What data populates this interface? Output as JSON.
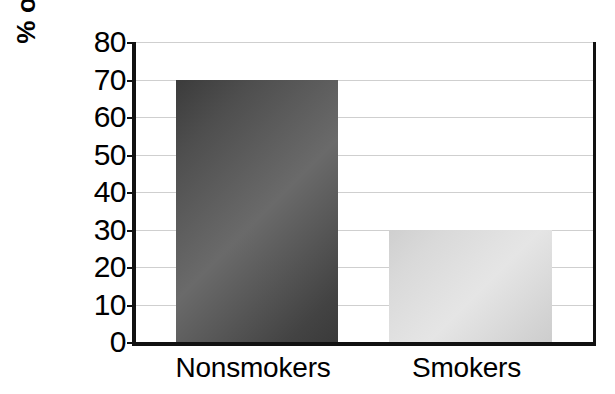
{
  "chart_data": {
    "type": "bar",
    "title": "",
    "subtitle": "",
    "xlabel": "",
    "ylabel": "% of Population",
    "categories": [
      "Nonsmokers",
      "Smokers"
    ],
    "values": [
      70,
      30
    ],
    "series": [
      {
        "name": "% of Population",
        "values": [
          70,
          30
        ]
      }
    ],
    "ylim": [
      0,
      80
    ],
    "y_ticks": [
      0,
      10,
      20,
      30,
      40,
      50,
      60,
      70,
      80
    ],
    "y_tick_labels": [
      "0",
      "10",
      "20",
      "30",
      "40",
      "50",
      "60",
      "70",
      "80"
    ],
    "x_tick_labels": [
      "Nonsmokers",
      "Smokers"
    ],
    "grid": "horizontal",
    "legend": "none",
    "annotations": [],
    "bar_colors": [
      "#5a5a5a",
      "#dadada"
    ],
    "bar_color_names": [
      "dark-gray",
      "light-gray"
    ],
    "axis_color": "#111111",
    "gridline_color": "#cfcfcf",
    "background_color": "#ffffff"
  },
  "axis": {
    "y_label": "% of Population",
    "ticks": [
      {
        "value": 80,
        "label": "80"
      },
      {
        "value": 70,
        "label": "70"
      },
      {
        "value": 60,
        "label": "60"
      },
      {
        "value": 50,
        "label": "50"
      },
      {
        "value": 40,
        "label": "40"
      },
      {
        "value": 30,
        "label": "30"
      },
      {
        "value": 20,
        "label": "20"
      },
      {
        "value": 10,
        "label": "10"
      },
      {
        "value": 0,
        "label": "0"
      }
    ]
  },
  "bars": [
    {
      "category": "Nonsmokers",
      "value": 70,
      "color": "#5a5a5a"
    },
    {
      "category": "Smokers",
      "value": 30,
      "color": "#dadada"
    }
  ]
}
